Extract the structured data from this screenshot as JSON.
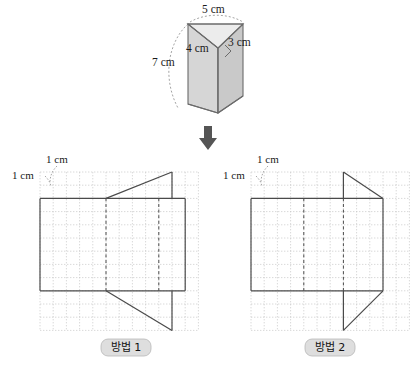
{
  "figure": {
    "title_present": false,
    "background_color": "#ffffff"
  },
  "prism": {
    "name": "triangular-prism",
    "face_fill_front": "#d6d6d6",
    "face_fill_side": "#c9c9c9",
    "face_fill_top": "#e6e6e6",
    "outline_color": "#6b6b6b",
    "dimensions": [
      {
        "id": "top-edge",
        "label": "5 cm",
        "value": 5,
        "unit": "cm"
      },
      {
        "id": "left-base-edge",
        "label": "4 cm",
        "value": 4,
        "unit": "cm"
      },
      {
        "id": "right-base-edge",
        "label": "3 cm",
        "value": 3,
        "unit": "cm"
      },
      {
        "id": "height-edge",
        "label": "7 cm",
        "value": 7,
        "unit": "cm"
      }
    ],
    "right_angle_marker": true
  },
  "arrow": {
    "name": "down-arrow",
    "direction": "down",
    "color": "#4d4d4d"
  },
  "grid": {
    "cell_label_horizontal": "1 cm",
    "cell_label_vertical": "1 cm",
    "cell_size_cm": 1,
    "line_color": "#c8c8c8",
    "line_style": "dotted"
  },
  "nets": [
    {
      "id": "net-1",
      "caption": "방법 1",
      "caption_box_fill": "#dedede",
      "outline_color": "#4a4a4a",
      "fold_line_style": "dashed",
      "triangle_orientation": "apex-right-top-and-bottom",
      "description": "rectangle body with two triangles whose apex is at the right"
    },
    {
      "id": "net-2",
      "caption": "방법 2",
      "caption_box_fill": "#dedede",
      "outline_color": "#4a4a4a",
      "fold_line_style": "dashed",
      "triangle_orientation": "apex-left-top-and-bottom",
      "description": "rectangle body with two triangles whose apex is at the left"
    }
  ]
}
